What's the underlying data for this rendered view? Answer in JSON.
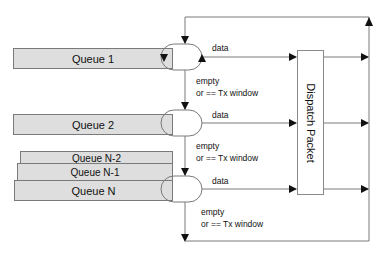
{
  "diagram": {
    "queues": [
      {
        "label": "Queue 1"
      },
      {
        "label": "Queue 2"
      },
      {
        "label": "Queue N-2"
      },
      {
        "label": "Queue N-1"
      },
      {
        "label": "Queue N"
      }
    ],
    "dispatch_label": "Dispatch Packet",
    "edge_labels": {
      "data_1": "data",
      "data_2": "data",
      "data_3": "data",
      "empty_1": "empty",
      "cond_1": "or == Tx window",
      "empty_2": "empty",
      "cond_2": "or == Tx window",
      "empty_3": "empty",
      "cond_3": "or == Tx window"
    },
    "colors": {
      "queue_fill": "#dedede",
      "line": "#7a7a7a",
      "arrow": "#111111"
    }
  }
}
